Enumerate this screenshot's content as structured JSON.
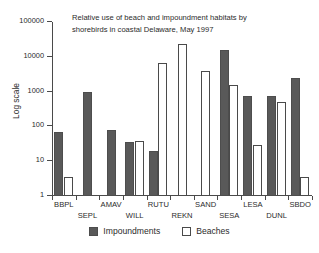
{
  "chart_data": {
    "type": "bar",
    "title": "Relative use of beach and impoundment habitats by\nshorebirds in coastal Delaware, May 1997",
    "xlabel": "",
    "ylabel": "Log scale",
    "yscale": "log",
    "ylim": [
      1,
      100000
    ],
    "ytick_labels": [
      "1",
      "10",
      "100",
      "1000",
      "10000",
      "100000"
    ],
    "ytick_values": [
      1,
      10,
      100,
      1000,
      10000,
      100000
    ],
    "grid": false,
    "legend_position": "bottom",
    "categories": [
      "BBPL",
      "SEPL",
      "AMAV",
      "WILL",
      "RUTU",
      "REKN",
      "SAND",
      "SESA",
      "LESA",
      "DUNL",
      "SBDO"
    ],
    "series": [
      {
        "name": "Impoundments",
        "color": "#595959",
        "values": [
          70,
          1000,
          80,
          35,
          20,
          null,
          null,
          16000,
          750,
          730,
          2500
        ]
      },
      {
        "name": "Beaches",
        "color": "#ffffff",
        "values": [
          3.5,
          null,
          null,
          38,
          6700,
          24000,
          4000,
          1500,
          30,
          500,
          3.5
        ]
      }
    ]
  },
  "legend": {
    "items": [
      {
        "label": "Impoundments"
      },
      {
        "label": "Beaches"
      }
    ]
  }
}
